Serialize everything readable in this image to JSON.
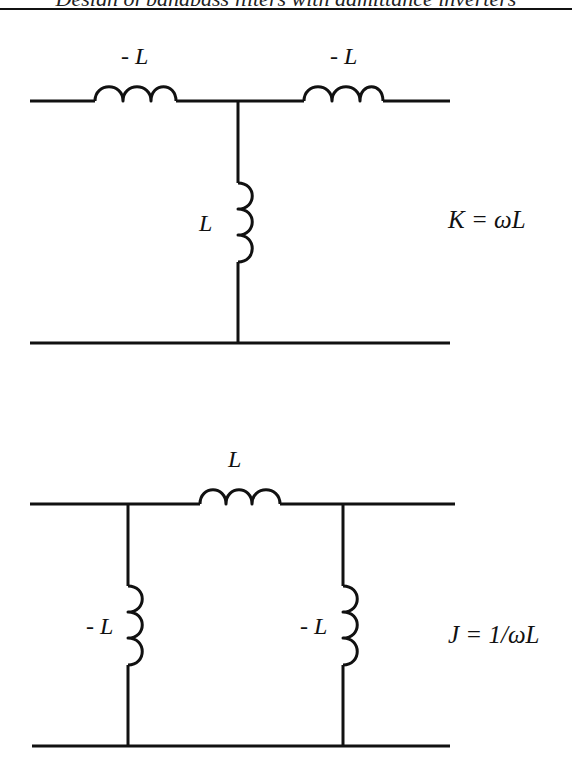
{
  "header": {
    "text": "Design of bandpass filters with admittance inverters"
  },
  "circuits": [
    {
      "name": "K-inverter (T network)",
      "series_left_label": "- L",
      "series_right_label": "- L",
      "shunt_label": "L",
      "formula": "K =  ωL"
    },
    {
      "name": "J-inverter (Pi network)",
      "series_label": "L",
      "shunt_left_label": "- L",
      "shunt_right_label": "- L",
      "formula": "J = 1/ωL"
    }
  ],
  "colors": {
    "line": "#111111",
    "background": "#ffffff"
  }
}
